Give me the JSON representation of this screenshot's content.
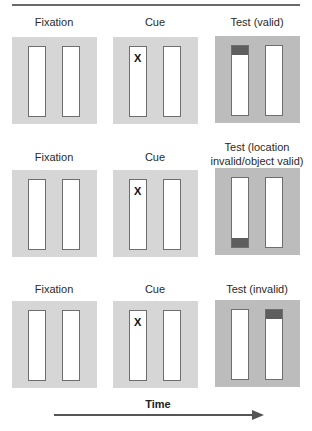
{
  "figure": {
    "rows": [
      {
        "fixation_label": "Fixation",
        "cue_label": "Cue",
        "cue_mark": "X",
        "test_label_line1": "Test (valid)",
        "test_label_line2": "",
        "target_bar": "left",
        "target_position": "top"
      },
      {
        "fixation_label": "Fixation",
        "cue_label": "Cue",
        "cue_mark": "X",
        "test_label_line1": "Test (location",
        "test_label_line2": "invalid/object valid)",
        "target_bar": "left",
        "target_position": "bottom"
      },
      {
        "fixation_label": "Fixation",
        "cue_label": "Cue",
        "cue_mark": "X",
        "test_label_line1": "Test (invalid)",
        "test_label_line2": "",
        "target_bar": "right",
        "target_position": "top"
      }
    ],
    "time_label": "Time",
    "colors": {
      "panel_light": "#d6d6d6",
      "panel_test": "#bcbcbc",
      "target_fill": "#5e5e5e",
      "bar_border": "#6e6e6e"
    }
  }
}
